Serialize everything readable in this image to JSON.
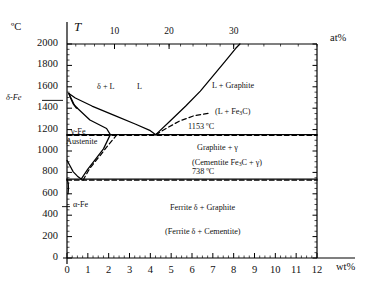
{
  "chart_data": {
    "type": "line",
    "xlabel": "wt%",
    "ylabel": "°C",
    "xlim": [
      0,
      12
    ],
    "ylim": [
      0,
      2000
    ],
    "grid": false,
    "axes": {
      "y_unit": "°C",
      "y_symbol": "T",
      "y_ticks": [
        0,
        200,
        400,
        600,
        800,
        1000,
        1200,
        1400,
        1600,
        1800,
        2000
      ],
      "x_ticks": [
        0,
        1,
        2,
        3,
        4,
        5,
        6,
        7,
        8,
        9,
        10,
        11,
        12
      ],
      "x_unit": "wt%",
      "top_unit": "at%",
      "top_ticks": [
        10,
        20,
        30
      ],
      "top_tick_x_wt": [
        2.28,
        4.9,
        8.0
      ]
    },
    "invariant_temperatures": [
      {
        "label": "1153 ºC",
        "value": 1153,
        "type": "eutectic-graphite"
      },
      {
        "label": "738 ºC",
        "value": 738,
        "type": "eutectoid-graphite"
      }
    ],
    "regions": [
      {
        "name": "delta-plus-liquid",
        "label": "δ + L",
        "x_wt": 0.82,
        "t": 1520
      },
      {
        "name": "liquid",
        "label": "L",
        "x_wt": 2.55,
        "t": 1530
      },
      {
        "name": "liquid-plus-graphite",
        "label": "L + Graphite",
        "x_wt": 7.1,
        "t": 1510
      },
      {
        "name": "liquid-plus-cementite",
        "label": "(L + Fe₃C)",
        "x_wt": 7.2,
        "t": 1370
      },
      {
        "name": "graphite-plus-gamma",
        "label": "Graphite + γ",
        "x_wt": 6.6,
        "t": 1060
      },
      {
        "name": "cementite-plus-gamma",
        "label": "(Cementite Fe₃C + γ)",
        "x_wt": 6.9,
        "t": 960
      },
      {
        "name": "ferrite-plus-graphite",
        "label": "Ferrite δ + Graphite",
        "x_wt": 7.3,
        "t": 430
      },
      {
        "name": "ferrite-plus-cementite",
        "label": "(Ferrite δ + Cementite)",
        "x_wt": 7.3,
        "t": 230
      }
    ],
    "phase_labels": [
      {
        "name": "delta-fe",
        "label": "δ-Fe",
        "x_wt": -1.05,
        "t": 1473
      },
      {
        "name": "gamma-fe",
        "label": "γ-Fe",
        "x_wt": 0.45,
        "t": 1225
      },
      {
        "name": "austenite",
        "label": "Austenite",
        "x_wt": 0.5,
        "t": 1155
      },
      {
        "name": "alpha-fe",
        "label": "α-Fe",
        "x_wt": 0.72,
        "t": 480
      }
    ],
    "series": [
      {
        "name": "liquidus-left",
        "style": "solid",
        "points": [
          [
            0.09,
            1538
          ],
          [
            0.4,
            1495
          ],
          [
            1.2,
            1420
          ],
          [
            2.3,
            1330
          ],
          [
            3.3,
            1250
          ],
          [
            4.0,
            1190
          ],
          [
            4.26,
            1153
          ]
        ]
      },
      {
        "name": "liquidus-right-graphite",
        "style": "solid",
        "points": [
          [
            4.26,
            1153
          ],
          [
            5.0,
            1290
          ],
          [
            5.7,
            1420
          ],
          [
            6.4,
            1560
          ],
          [
            7.0,
            1700
          ],
          [
            7.6,
            1840
          ],
          [
            8.1,
            1960
          ],
          [
            8.3,
            2000
          ]
        ]
      },
      {
        "name": "liquidus-right-cementite",
        "style": "dashed",
        "points": [
          [
            4.26,
            1153
          ],
          [
            4.8,
            1215
          ],
          [
            5.4,
            1280
          ],
          [
            6.1,
            1330
          ],
          [
            6.9,
            1355
          ]
        ]
      },
      {
        "name": "delta-solidus",
        "style": "solid",
        "points": [
          [
            0.09,
            1538
          ],
          [
            0.17,
            1495
          ],
          [
            0.3,
            1440
          ],
          [
            0.45,
            1400
          ]
        ]
      },
      {
        "name": "delta-gamma-boundary",
        "style": "solid",
        "points": [
          [
            0.09,
            1538
          ],
          [
            0.35,
            1430
          ],
          [
            0.5,
            1400
          ]
        ]
      },
      {
        "name": "gamma-solidus",
        "style": "solid",
        "points": [
          [
            0.5,
            1400
          ],
          [
            1.1,
            1290
          ],
          [
            1.9,
            1210
          ],
          [
            2.08,
            1153
          ]
        ]
      },
      {
        "name": "acm-graphite",
        "style": "solid",
        "points": [
          [
            0.68,
            738
          ],
          [
            1.0,
            830
          ],
          [
            1.4,
            930
          ],
          [
            1.75,
            1020
          ],
          [
            2.08,
            1153
          ]
        ]
      },
      {
        "name": "acm-cementite",
        "style": "dashed",
        "points": [
          [
            0.77,
            727
          ],
          [
            1.1,
            840
          ],
          [
            1.6,
            960
          ],
          [
            2.0,
            1060
          ],
          [
            2.4,
            1153
          ]
        ]
      },
      {
        "name": "a3-gamma-alpha",
        "style": "solid",
        "points": [
          [
            0.0,
            912
          ],
          [
            0.15,
            860
          ],
          [
            0.3,
            805
          ],
          [
            0.5,
            765
          ],
          [
            0.68,
            738
          ]
        ]
      },
      {
        "name": "alpha-solvus",
        "style": "solid",
        "points": [
          [
            0.0,
            738
          ],
          [
            0.06,
            700
          ],
          [
            0.07,
            650
          ],
          [
            0.05,
            600
          ]
        ]
      },
      {
        "name": "eutectic-graphite-line",
        "style": "solid",
        "points": [
          [
            0.0,
            1153
          ],
          [
            12.0,
            1153
          ]
        ]
      },
      {
        "name": "eutectic-cementite-line",
        "style": "dashed",
        "points": [
          [
            0.0,
            1147
          ],
          [
            12.0,
            1147
          ]
        ]
      },
      {
        "name": "eutectoid-graphite-line",
        "style": "solid",
        "points": [
          [
            0.0,
            738
          ],
          [
            12.0,
            738
          ]
        ]
      },
      {
        "name": "eutectoid-cementite-line",
        "style": "dashed",
        "points": [
          [
            0.0,
            727
          ],
          [
            12.0,
            727
          ]
        ]
      }
    ]
  },
  "figure": {
    "y_axis_unit": "ºC",
    "y_axis_symbol": "T",
    "x_axis_unit": "wt%",
    "top_axis_unit": "at%",
    "y_tick_labels": [
      "2000",
      "1800",
      "1600",
      "1400",
      "1200",
      "1000",
      "800",
      "600",
      "400",
      "200",
      "0"
    ],
    "x_tick_labels": [
      "0",
      "1",
      "2",
      "3",
      "4",
      "5",
      "6",
      "7",
      "8",
      "9",
      "10",
      "11",
      "12"
    ],
    "top_tick_labels": [
      "10",
      "20",
      "30"
    ],
    "annotations": {
      "delta_fe": "δ-Fe",
      "delta_plus_L": "δ + L",
      "liquid": "L",
      "gamma_fe": "γ-Fe",
      "austenite": "Austenite",
      "alpha_fe": "α-Fe",
      "L_plus_graphite": "L + Graphite",
      "L_plus_cementite_pre": "(L + Fe",
      "L_plus_cementite_sub": "3",
      "L_plus_cementite_post": "C)",
      "temp_eutectic": "1153 ºC",
      "temp_eutectoid": "738 ºC",
      "graphite_plus_gamma": "Graphite + γ",
      "cementite_gamma_pre": "(Cementite Fe",
      "cementite_gamma_sub": "3",
      "cementite_gamma_post": "C + γ)",
      "ferrite_graphite": "Ferrite δ + Graphite",
      "ferrite_cementite": "(Ferrite δ + Cementite)"
    },
    "colors": {
      "line": "#000000",
      "text": "#111111",
      "background": "#ffffff"
    }
  }
}
